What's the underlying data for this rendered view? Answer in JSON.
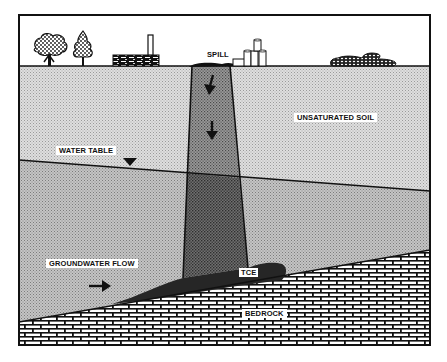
{
  "diagram": {
    "title": "",
    "labels": {
      "spill": "SPILL",
      "unsaturated_soil": "UNSATURATED SOIL",
      "water_table": "WATER TABLE",
      "groundwater_flow": "GROUNDWATER FLOW",
      "tce": "TCE",
      "bedrock": "BEDROCK"
    },
    "surface_features": [
      {
        "name": "deciduous-tree"
      },
      {
        "name": "conifer-tree"
      },
      {
        "name": "factory-building"
      },
      {
        "name": "drums-stack"
      },
      {
        "name": "shrubs"
      }
    ],
    "arrows": [
      {
        "name": "downward-flow-arrow-1"
      },
      {
        "name": "downward-flow-arrow-2"
      },
      {
        "name": "groundwater-flow-arrow"
      }
    ],
    "colors": {
      "sky": "#ffffff",
      "unsaturated": "#d6d6d6",
      "saturated": "#bdbdbd",
      "plume_upper": "#8f8f8f",
      "plume_lower": "#6a6a6a",
      "tce_pool": "#2a2a2a",
      "bedrock_fill": "#ffffff",
      "line": "#111111"
    }
  }
}
